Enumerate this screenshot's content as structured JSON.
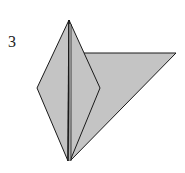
{
  "diagram": {
    "step_label": "3",
    "fill_color": "#c4c4c4",
    "stroke_color": "#1a1a1a"
  }
}
